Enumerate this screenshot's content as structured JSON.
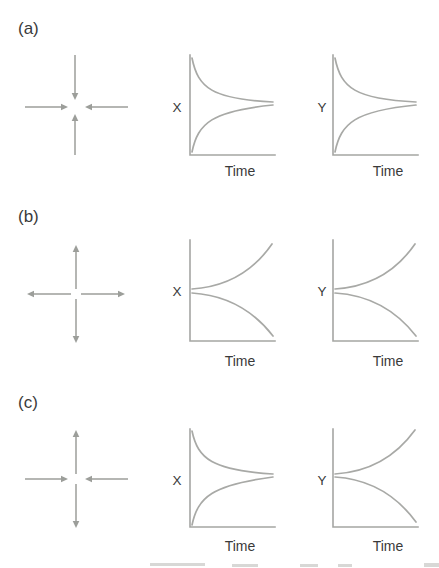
{
  "figure": {
    "colors": {
      "background": "#ffffff",
      "curve_gray": "#a8a9a6",
      "arrow_gray": "#9c9e9a",
      "text_dark": "#3a3a3a"
    },
    "panels": [
      {
        "label": "(a)",
        "flow": {
          "horizontal_arrows": "inward",
          "vertical_arrows": "inward"
        },
        "plots": [
          {
            "y_axis_label": "X",
            "x_axis_label": "Time",
            "curves": "upper and lower curves converging to middle level"
          },
          {
            "y_axis_label": "Y",
            "x_axis_label": "Time",
            "curves": "upper and lower curves converging to middle level"
          }
        ]
      },
      {
        "label": "(b)",
        "flow": {
          "horizontal_arrows": "outward",
          "vertical_arrows": "outward"
        },
        "plots": [
          {
            "y_axis_label": "X",
            "x_axis_label": "Time",
            "curves": "two curves diverging from middle level"
          },
          {
            "y_axis_label": "Y",
            "x_axis_label": "Time",
            "curves": "two curves diverging from middle level"
          }
        ]
      },
      {
        "label": "(c)",
        "flow": {
          "horizontal_arrows": "inward",
          "vertical_arrows": "outward"
        },
        "plots": [
          {
            "y_axis_label": "X",
            "x_axis_label": "Time",
            "curves": "upper and lower curves converging to middle level"
          },
          {
            "y_axis_label": "Y",
            "x_axis_label": "Time",
            "curves": "two curves diverging from middle level"
          }
        ]
      }
    ]
  }
}
